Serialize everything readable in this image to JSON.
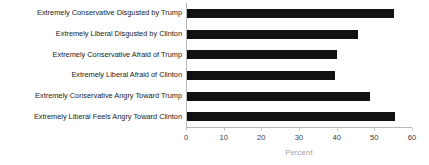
{
  "chart_data": {
    "type": "bar",
    "orientation": "horizontal",
    "title": "",
    "xlabel": "Percent",
    "ylabel": "",
    "xlim": [
      0,
      60
    ],
    "xticks": [
      0,
      10,
      20,
      30,
      40,
      50,
      60
    ],
    "grid": false,
    "legend": null,
    "bar_color": "#111111",
    "axis_color": "#b9b9b9",
    "categories": [
      "Extremely Conservative Disgusted by Trump",
      "Extremely Liberal Disgusted by Clinton",
      "Extremely Conservative Afraid of Trump",
      "Extremely Liberal Afraid of Clinton",
      "Extremely Conservative Angry Toward Trump",
      "Extremely Liberal Feels Angry Toward Clinton"
    ],
    "values": [
      55,
      45.5,
      39.7,
      39.2,
      48.7,
      55.1
    ]
  }
}
